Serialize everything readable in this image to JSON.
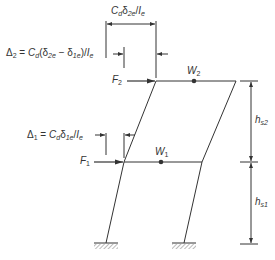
{
  "diagram": {
    "type": "two-story frame drift diagram",
    "colors": {
      "line": "#333333",
      "background": "#ffffff"
    },
    "labels": {
      "top_dimension": {
        "C": "C",
        "C_sub": "d",
        "delta": "δ",
        "delta_sub": "2e",
        "slash": "/",
        "I": "I",
        "I_sub": "e"
      },
      "delta2": {
        "Delta": "Δ",
        "Delta_sub": "2",
        "eq": " = ",
        "C": "C",
        "C_sub": "d",
        "open": "(",
        "d1": "δ",
        "d1_sub": "2e",
        "minus": " − ",
        "d2": "δ",
        "d2_sub": "1e",
        "close": ")/",
        "I": "I",
        "I_sub": "e"
      },
      "delta1": {
        "Delta": "Δ",
        "Delta_sub": "1",
        "eq": " = ",
        "C": "C",
        "C_sub": "d",
        "d": "δ",
        "d_sub": "1e",
        "slash": "/",
        "I": "I",
        "I_sub": "e"
      },
      "F2": {
        "F": "F",
        "sub": "2"
      },
      "F1": {
        "F": "F",
        "sub": "1"
      },
      "W2": {
        "W": "W",
        "sub": "2"
      },
      "W1": {
        "W": "W",
        "sub": "1"
      },
      "hs2": {
        "h": "h",
        "sub": "s2"
      },
      "hs1": {
        "h": "h",
        "sub": "s1"
      }
    }
  }
}
